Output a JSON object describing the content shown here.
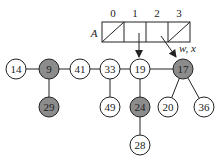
{
  "diagram": {
    "array": {
      "name": "A",
      "indices": [
        "0",
        "1",
        "2",
        "3"
      ],
      "cells": [
        {
          "index": "0",
          "nil": true
        },
        {
          "index": "1",
          "nil": false,
          "points_to": "19"
        },
        {
          "index": "2",
          "nil": false,
          "points_to": "17"
        },
        {
          "index": "3",
          "nil": true
        }
      ]
    },
    "pointer_label": "w, x",
    "nodes": [
      {
        "id": "n14",
        "key": "14",
        "shaded": false
      },
      {
        "id": "n9",
        "key": "9",
        "shaded": true
      },
      {
        "id": "n41",
        "key": "41",
        "shaded": false
      },
      {
        "id": "n33",
        "key": "33",
        "shaded": false
      },
      {
        "id": "n19",
        "key": "19",
        "shaded": false
      },
      {
        "id": "n17",
        "key": "17",
        "shaded": true
      },
      {
        "id": "n29",
        "key": "29",
        "shaded": true
      },
      {
        "id": "n49",
        "key": "49",
        "shaded": false
      },
      {
        "id": "n24",
        "key": "24",
        "shaded": true
      },
      {
        "id": "n20",
        "key": "20",
        "shaded": false
      },
      {
        "id": "n36",
        "key": "36",
        "shaded": false
      },
      {
        "id": "n28",
        "key": "28",
        "shaded": false
      }
    ],
    "colors": {
      "shaded": "#8c8c8c",
      "unshaded": "#ffffff",
      "stroke": "#222222"
    }
  }
}
